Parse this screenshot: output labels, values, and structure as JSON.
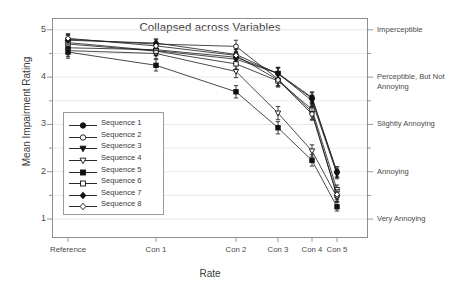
{
  "chart_data": {
    "type": "line",
    "title": "Collapsed across Variables",
    "xlabel": "Rate",
    "ylabel": "Mean Impairment Rating",
    "categories": [
      "Reference",
      "Con 1",
      "Con 2",
      "Con 3",
      "Con 4",
      "Con 5"
    ],
    "x_positions": [
      68,
      156,
      236,
      278,
      312,
      337
    ],
    "ylim": [
      0.6,
      5.25
    ],
    "yticks": [
      1,
      2,
      3,
      4,
      5
    ],
    "ytick_labels": [
      "1",
      "2",
      "3",
      "4",
      "5"
    ],
    "grid": "horizontal-faint",
    "legend_position": "inside-left",
    "error_bars": "standard error",
    "right_axis_labels": [
      {
        "value": 5,
        "text": "Imperceptible"
      },
      {
        "value": 4,
        "text": "Perceptible, But Not Annoying"
      },
      {
        "value": 3,
        "text": "Slightly Annoying"
      },
      {
        "value": 2,
        "text": "Annoying"
      },
      {
        "value": 1,
        "text": "Very Annoying"
      }
    ],
    "series": [
      {
        "name": "Sequence 1",
        "marker": "filled-circle",
        "values": [
          4.62,
          4.58,
          4.42,
          4.08,
          3.57,
          2.0
        ],
        "errors": [
          0.12,
          0.1,
          0.12,
          0.13,
          0.12,
          0.11
        ]
      },
      {
        "name": "Sequence 2",
        "marker": "open-circle",
        "values": [
          4.8,
          4.7,
          4.65,
          3.96,
          3.26,
          1.48
        ],
        "errors": [
          0.1,
          0.09,
          0.13,
          0.14,
          0.15,
          0.1
        ]
      },
      {
        "name": "Sequence 3",
        "marker": "filled-triangle-down",
        "values": [
          4.73,
          4.56,
          4.38,
          4.08,
          3.5,
          1.95
        ],
        "errors": [
          0.11,
          0.1,
          0.11,
          0.12,
          0.12,
          0.1
        ]
      },
      {
        "name": "Sequence 4",
        "marker": "open-triangle-down",
        "values": [
          4.56,
          4.5,
          4.12,
          3.24,
          2.44,
          1.46
        ],
        "errors": [
          0.12,
          0.11,
          0.13,
          0.14,
          0.13,
          0.09
        ]
      },
      {
        "name": "Sequence 5",
        "marker": "filled-square",
        "values": [
          4.53,
          4.25,
          3.69,
          2.93,
          2.24,
          1.26
        ],
        "errors": [
          0.13,
          0.12,
          0.13,
          0.13,
          0.12,
          0.09
        ]
      },
      {
        "name": "Sequence 6",
        "marker": "open-square",
        "values": [
          4.7,
          4.55,
          4.28,
          3.92,
          3.32,
          1.62
        ],
        "errors": [
          0.11,
          0.1,
          0.11,
          0.13,
          0.14,
          0.1
        ]
      },
      {
        "name": "Sequence 7",
        "marker": "filled-diamond",
        "values": [
          4.78,
          4.72,
          4.48,
          4.07,
          3.55,
          1.98
        ],
        "errors": [
          0.1,
          0.09,
          0.11,
          0.12,
          0.12,
          0.1
        ]
      },
      {
        "name": "Sequence 8",
        "marker": "open-diamond",
        "values": [
          4.82,
          4.66,
          4.46,
          3.94,
          3.22,
          1.52
        ],
        "errors": [
          0.1,
          0.1,
          0.12,
          0.13,
          0.13,
          0.1
        ]
      }
    ]
  },
  "legend": {
    "items": [
      {
        "label": "Sequence 1"
      },
      {
        "label": "Sequence 2"
      },
      {
        "label": "Sequence 3"
      },
      {
        "label": "Sequence 4"
      },
      {
        "label": "Sequence 5"
      },
      {
        "label": "Sequence 6"
      },
      {
        "label": "Sequence 7"
      },
      {
        "label": "Sequence 8"
      }
    ]
  },
  "colors": {
    "line": "#1a1a1a",
    "axis": "#8d8d8d",
    "grid": "#e2e2e2",
    "text": "#3a3a3a"
  }
}
